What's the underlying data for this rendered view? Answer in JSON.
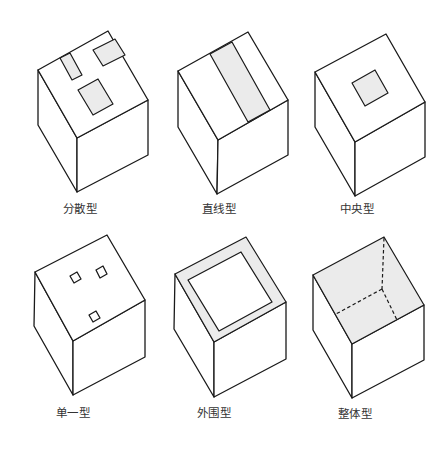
{
  "title": "",
  "colors": {
    "line": "#1a1a1a",
    "shade": "#ebebeb",
    "background": "#ffffff",
    "label": "#333333"
  },
  "cubes": [
    {
      "id": "distributed",
      "label": "分散型",
      "top_pattern": "three scattered shaded rectangles"
    },
    {
      "id": "linear",
      "label": "直线型",
      "top_pattern": "one shaded strip crossing the top face"
    },
    {
      "id": "central",
      "label": "中央型",
      "top_pattern": "one shaded square in the centre"
    },
    {
      "id": "single",
      "label": "单一型",
      "top_pattern": "three small unshaded square openings"
    },
    {
      "id": "peripheral",
      "label": "外围型",
      "top_pattern": "shaded border ring around top face"
    },
    {
      "id": "overall",
      "label": "整体型",
      "top_pattern": "entire top face shaded with dashed hidden edges"
    }
  ]
}
